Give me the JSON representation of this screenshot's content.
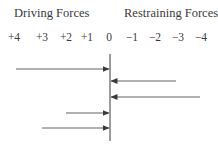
{
  "headings": {
    "driving": "Driving Forces",
    "restraining": "Restraining Forces"
  },
  "scale": {
    "ticks": [
      {
        "label": "+4",
        "x": 14
      },
      {
        "label": "+3",
        "x": 42
      },
      {
        "label": "+2",
        "x": 66
      },
      {
        "label": "+1",
        "x": 87
      },
      {
        "label": "0",
        "x": 109
      },
      {
        "label": "−1",
        "x": 132
      },
      {
        "label": "−2",
        "x": 155
      },
      {
        "label": "−3",
        "x": 178
      },
      {
        "label": "−4",
        "x": 201
      }
    ]
  },
  "arrows": [
    {
      "type": "driving",
      "strength": 4,
      "y": 69
    },
    {
      "type": "restraining",
      "strength": -3,
      "y": 81
    },
    {
      "type": "restraining",
      "strength": -4,
      "y": 97
    },
    {
      "type": "driving",
      "strength": 2,
      "y": 113
    },
    {
      "type": "driving",
      "strength": 3,
      "y": 128
    }
  ],
  "colors": {
    "line": "#3a3a3a"
  }
}
